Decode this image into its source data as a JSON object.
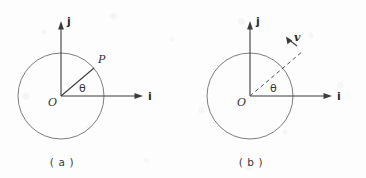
{
  "figure": {
    "background_color": "#fdfdfd",
    "ink_color": "#3c3c3e",
    "circle_color": "#6e6e72",
    "width": 366,
    "height": 178,
    "panels": [
      {
        "id": "a",
        "caption": "( a )",
        "center": {
          "x": 61,
          "y": 96
        },
        "radius": 43,
        "axes": [
          {
            "name": "j",
            "label": "j",
            "direction": "up",
            "length": 70
          },
          {
            "name": "i",
            "label": "i",
            "direction": "right",
            "length": 82
          }
        ],
        "origin_label": "O",
        "angle_label": "θ",
        "angle_degrees": 40,
        "point_label": "P",
        "radius_line_style": "solid",
        "vector_label": null
      },
      {
        "id": "b",
        "caption": "( b )",
        "center": {
          "x": 250,
          "y": 96
        },
        "radius": 43,
        "axes": [
          {
            "name": "j",
            "label": "j",
            "direction": "up",
            "length": 70
          },
          {
            "name": "i",
            "label": "i",
            "direction": "right",
            "length": 82
          }
        ],
        "origin_label": "O",
        "angle_label": "θ",
        "angle_degrees": 40,
        "point_label": null,
        "radius_line_style": "dashed",
        "vector_label": "v"
      }
    ]
  },
  "labels": {
    "panel_a": {
      "j_axis": "j",
      "i_axis": "i",
      "origin": "O",
      "theta": "θ",
      "point_p": "P",
      "caption": "( a )"
    },
    "panel_b": {
      "j_axis": "j",
      "i_axis": "i",
      "origin": "O",
      "theta": "θ",
      "vector_v": "v",
      "caption": "( b )"
    }
  }
}
